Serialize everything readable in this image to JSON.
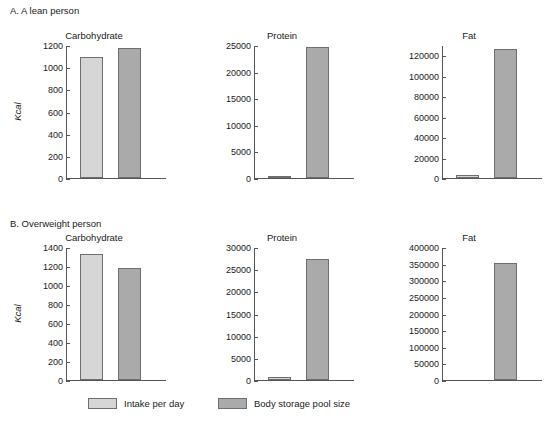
{
  "figure": {
    "panels": [
      {
        "id": "A",
        "label": "A. A lean person"
      },
      {
        "id": "B",
        "label": "B. Overweight person"
      }
    ],
    "ylabel": "Kcal",
    "legend": [
      {
        "key": "intake",
        "label": "Intake per day",
        "color": "#d6d6d6"
      },
      {
        "key": "storage",
        "label": "Body storage pool size",
        "color": "#aaaaaa"
      }
    ]
  },
  "chart_data": [
    {
      "type": "bar",
      "title": "Carbohydrate",
      "panel": "A. A lean person",
      "categories": [
        "Intake per day",
        "Body storage pool size"
      ],
      "values": [
        1090,
        1175
      ],
      "xlabel": "",
      "ylabel": "Kcal",
      "ylim": [
        0,
        1200
      ],
      "yticks": [
        0,
        200,
        400,
        600,
        800,
        1000,
        1200
      ],
      "ytick_labels": [
        "0",
        "200",
        "400",
        "600",
        "800",
        "1000",
        "1200"
      ],
      "grid": false,
      "legend_position": "bottom"
    },
    {
      "type": "bar",
      "title": "Protein",
      "panel": "A. A lean person",
      "categories": [
        "Intake per day",
        "Body storage pool size"
      ],
      "values": [
        450,
        24700
      ],
      "xlabel": "",
      "ylabel": "Kcal",
      "ylim": [
        0,
        25000
      ],
      "yticks": [
        0,
        5000,
        10000,
        15000,
        20000,
        25000
      ],
      "ytick_labels": [
        "0",
        "5000",
        "10000",
        "15000",
        "20000",
        "25000"
      ],
      "grid": false,
      "legend_position": "bottom"
    },
    {
      "type": "bar",
      "title": "Fat",
      "panel": "A. A lean person",
      "categories": [
        "Intake per day",
        "Body storage pool size"
      ],
      "values": [
        2500,
        126000
      ],
      "xlabel": "",
      "ylabel": "Kcal",
      "ylim": [
        0,
        130000
      ],
      "yticks": [
        0,
        20000,
        40000,
        60000,
        80000,
        100000,
        120000
      ],
      "ytick_labels": [
        "0",
        "20000",
        "40000",
        "60000",
        "80000",
        "100000",
        "120000"
      ],
      "grid": false,
      "legend_position": "bottom"
    },
    {
      "type": "bar",
      "title": "Carbohydrate",
      "panel": "B. Overweight person",
      "categories": [
        "Intake per day",
        "Body storage pool size"
      ],
      "values": [
        1330,
        1175
      ],
      "xlabel": "",
      "ylabel": "Kcal",
      "ylim": [
        0,
        1400
      ],
      "yticks": [
        0,
        200,
        400,
        600,
        800,
        1000,
        1200,
        1400
      ],
      "ytick_labels": [
        "0",
        "200",
        "400",
        "600",
        "800",
        "1000",
        "1200",
        "1400"
      ],
      "grid": false,
      "legend_position": "bottom"
    },
    {
      "type": "bar",
      "title": "Protein",
      "panel": "B. Overweight person",
      "categories": [
        "Intake per day",
        "Body storage pool size"
      ],
      "values": [
        600,
        27400
      ],
      "xlabel": "",
      "ylabel": "Kcal",
      "ylim": [
        0,
        30000
      ],
      "yticks": [
        0,
        5000,
        10000,
        15000,
        20000,
        25000,
        30000
      ],
      "ytick_labels": [
        "0",
        "5000",
        "10000",
        "15000",
        "20000",
        "25000",
        "30000"
      ],
      "grid": false,
      "legend_position": "bottom"
    },
    {
      "type": "bar",
      "title": "Fat",
      "panel": "B. Overweight person",
      "categories": [
        "Intake per day",
        "Body storage pool size"
      ],
      "values": [
        1200,
        353000
      ],
      "xlabel": "",
      "ylabel": "Kcal",
      "ylim": [
        0,
        400000
      ],
      "yticks": [
        0,
        50000,
        100000,
        150000,
        200000,
        250000,
        300000,
        350000,
        400000
      ],
      "ytick_labels": [
        "0",
        "50000",
        "100000",
        "150000",
        "200000",
        "250000",
        "300000",
        "350000",
        "400000"
      ],
      "grid": false,
      "legend_position": "bottom"
    }
  ]
}
